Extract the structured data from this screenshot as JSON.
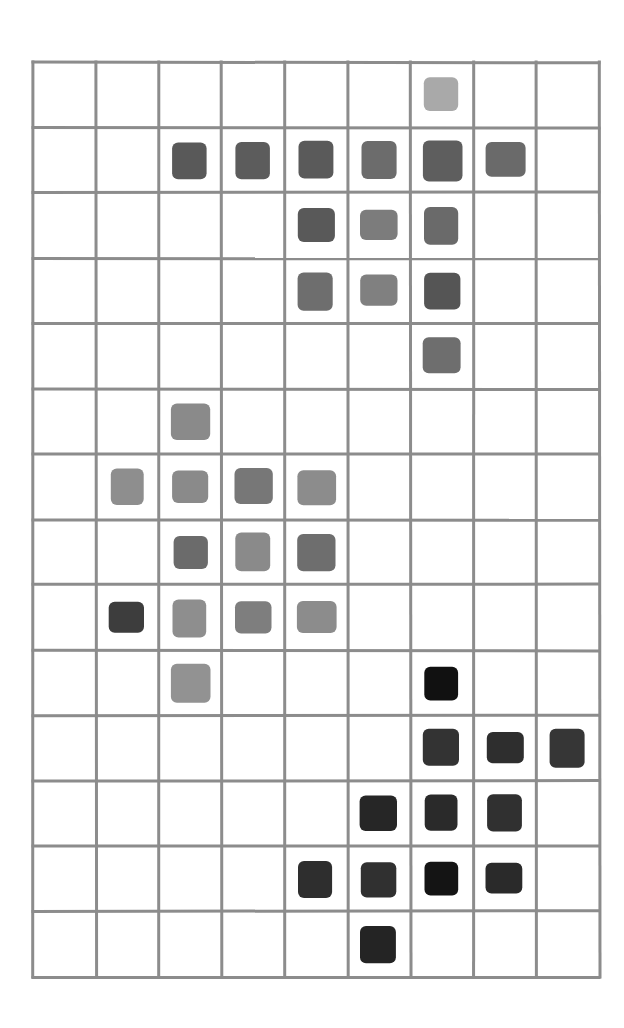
{
  "grid": {
    "columns": 9,
    "rows": 14,
    "line_color": "#8c8c8c",
    "background": "#ffffff"
  },
  "shaded_cells": [
    {
      "row": 0,
      "col": 6,
      "color": "#a9a9a9"
    },
    {
      "row": 1,
      "col": 2,
      "color": "#595959"
    },
    {
      "row": 1,
      "col": 3,
      "color": "#5c5c5c"
    },
    {
      "row": 1,
      "col": 4,
      "color": "#5a5a5a"
    },
    {
      "row": 1,
      "col": 5,
      "color": "#6c6c6c"
    },
    {
      "row": 1,
      "col": 6,
      "color": "#5e5e5e"
    },
    {
      "row": 1,
      "col": 7,
      "color": "#6a6a6a"
    },
    {
      "row": 2,
      "col": 4,
      "color": "#595959"
    },
    {
      "row": 2,
      "col": 5,
      "color": "#7c7c7c"
    },
    {
      "row": 2,
      "col": 6,
      "color": "#6a6a6a"
    },
    {
      "row": 3,
      "col": 4,
      "color": "#6e6e6e"
    },
    {
      "row": 3,
      "col": 5,
      "color": "#808080"
    },
    {
      "row": 3,
      "col": 6,
      "color": "#555555"
    },
    {
      "row": 4,
      "col": 6,
      "color": "#6e6e6e"
    },
    {
      "row": 5,
      "col": 2,
      "color": "#8a8a8a"
    },
    {
      "row": 6,
      "col": 1,
      "color": "#8e8e8e"
    },
    {
      "row": 6,
      "col": 2,
      "color": "#8a8a8a"
    },
    {
      "row": 6,
      "col": 3,
      "color": "#777777"
    },
    {
      "row": 6,
      "col": 4,
      "color": "#8c8c8c"
    },
    {
      "row": 7,
      "col": 2,
      "color": "#6b6b6b"
    },
    {
      "row": 7,
      "col": 3,
      "color": "#8a8a8a"
    },
    {
      "row": 7,
      "col": 4,
      "color": "#6e6e6e"
    },
    {
      "row": 8,
      "col": 1,
      "color": "#3d3d3d"
    },
    {
      "row": 8,
      "col": 2,
      "color": "#8e8e8e"
    },
    {
      "row": 8,
      "col": 3,
      "color": "#7e7e7e"
    },
    {
      "row": 8,
      "col": 4,
      "color": "#8c8c8c"
    },
    {
      "row": 9,
      "col": 2,
      "color": "#929292"
    },
    {
      "row": 9,
      "col": 6,
      "color": "#111111"
    },
    {
      "row": 10,
      "col": 6,
      "color": "#333333"
    },
    {
      "row": 10,
      "col": 7,
      "color": "#2e2e2e"
    },
    {
      "row": 10,
      "col": 8,
      "color": "#363636"
    },
    {
      "row": 11,
      "col": 5,
      "color": "#262626"
    },
    {
      "row": 11,
      "col": 6,
      "color": "#2a2a2a"
    },
    {
      "row": 11,
      "col": 7,
      "color": "#303030"
    },
    {
      "row": 12,
      "col": 4,
      "color": "#2e2e2e"
    },
    {
      "row": 12,
      "col": 5,
      "color": "#303030"
    },
    {
      "row": 12,
      "col": 6,
      "color": "#141414"
    },
    {
      "row": 12,
      "col": 7,
      "color": "#2a2a2a"
    },
    {
      "row": 13,
      "col": 5,
      "color": "#242424"
    }
  ]
}
